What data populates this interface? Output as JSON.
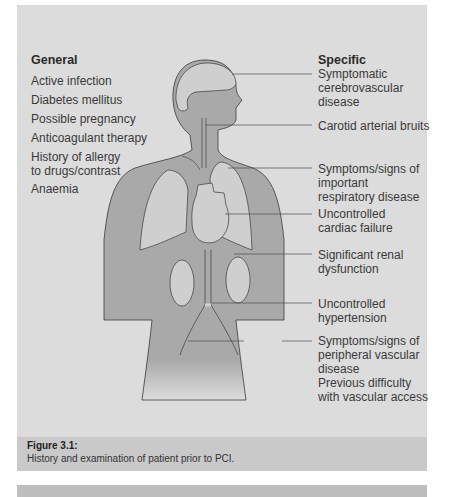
{
  "figure": {
    "general": {
      "heading": "General",
      "items": [
        "Active infection",
        "Diabetes mellitus",
        "Possible pregnancy",
        "Anticoagulant therapy",
        "History of allergy to drugs/contrast",
        "Anaemia"
      ]
    },
    "specific": {
      "heading": "Specific",
      "items": [
        "Symptomatic cerebrovascular disease",
        "Carotid arterial bruits",
        "Symptoms/signs of important respiratory disease",
        "Uncontrolled cardiac failure",
        "Significant renal dysfunction",
        "Uncontrolled hypertension",
        "Symptoms/signs of peripheral vascular disease",
        "Previous difficulty with vascular access"
      ]
    },
    "colors": {
      "panel": "#dcdcdc",
      "body": "#a9a9a9",
      "organs": "#cfcfcf",
      "caption_band": "#c9c9c9"
    }
  },
  "caption": {
    "title": "Figure 3.1:",
    "text": "History and examination of patient prior to PCI."
  }
}
